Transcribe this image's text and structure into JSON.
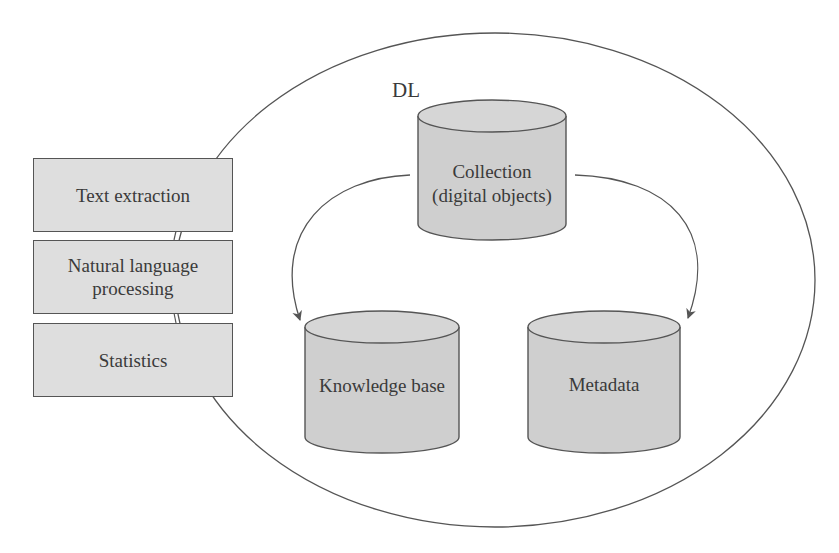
{
  "diagram": {
    "container_label": "DL",
    "process_boxes": [
      {
        "label": "Text extraction"
      },
      {
        "label": "Natural language processing"
      },
      {
        "label": "Statistics"
      }
    ],
    "data_stores": {
      "collection": {
        "label": "Collection (digital objects)"
      },
      "knowledge_base": {
        "label": "Knowledge base"
      },
      "metadata": {
        "label": "Metadata"
      }
    },
    "edges": [
      {
        "from": "Collection (digital objects)",
        "to": "Knowledge base"
      },
      {
        "from": "Collection (digital objects)",
        "to": "Metadata"
      }
    ],
    "colors": {
      "fill": "#dedede",
      "stroke": "#555555",
      "text": "#3a3a3a"
    }
  }
}
